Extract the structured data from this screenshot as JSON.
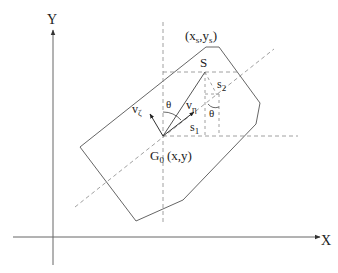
{
  "diagram": {
    "type": "geometry-schematic",
    "axes": {
      "x_label": "X",
      "y_label": "Y"
    },
    "points": {
      "origin_point": "G",
      "origin_subscript": "0",
      "origin_coords": "(x,y)",
      "target_point": "S",
      "target_coords_x": "(x",
      "target_coords_x_sub": "s",
      "target_coords_sep": ",y",
      "target_coords_y_sub": "s",
      "target_coords_close": ")"
    },
    "vectors": {
      "v_zeta": "v",
      "v_zeta_sub": "ζ",
      "v_eta": "v",
      "v_eta_sub": "η"
    },
    "segments": {
      "s1": "s",
      "s1_sub": "1",
      "s2": "s",
      "s2_sub": "2"
    },
    "angles": {
      "theta_left": "θ",
      "theta_right": "θ"
    },
    "colors": {
      "line": "#555555",
      "dashed": "#777777",
      "text": "#222222",
      "background": "#ffffff"
    }
  }
}
